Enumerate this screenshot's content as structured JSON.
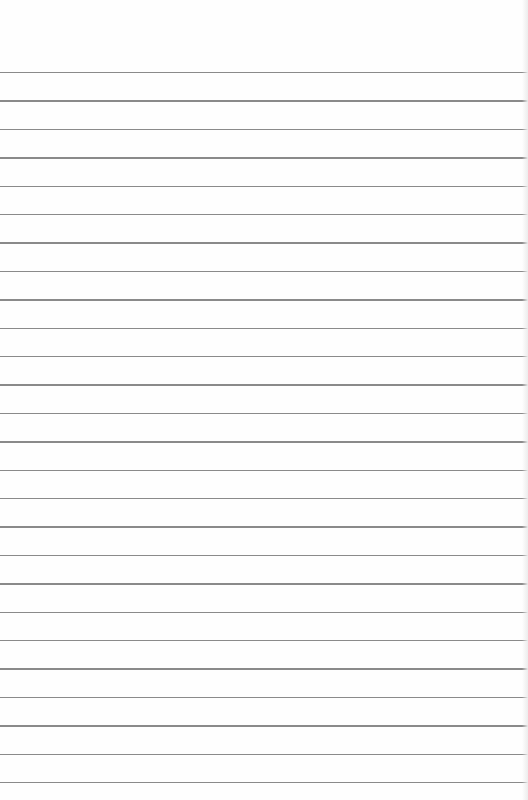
{
  "paper": {
    "type": "ruled-lined-paper",
    "background": "#fefefe",
    "line_color": "#8a8a8a",
    "first_line_y": 72,
    "line_spacing": 28.4,
    "line_count": 26
  }
}
